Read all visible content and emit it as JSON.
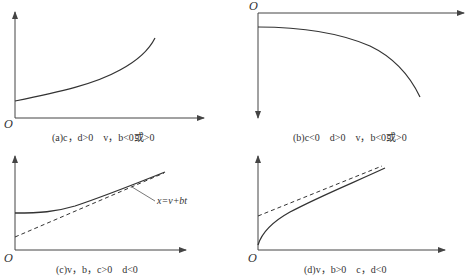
{
  "panels": [
    {
      "id": "a",
      "origin_label": "O",
      "caption": "(a)c，d>0　v，b<0或>0",
      "orientation": "y-up",
      "curves": [
        {
          "style": "solid",
          "shape": "convex increasing"
        }
      ]
    },
    {
      "id": "b",
      "origin_label": "O",
      "caption": "(b)c<0　d>0　v，b<0或>0",
      "orientation": "y-down",
      "curves": [
        {
          "style": "solid",
          "shape": "concave decreasing"
        }
      ]
    },
    {
      "id": "c",
      "origin_label": "O",
      "caption": "(c)v，b，c>0　d<0",
      "orientation": "y-up",
      "annotation": "x=v+bt",
      "curves": [
        {
          "style": "solid",
          "shape": "convex increasing, asymptotic to line"
        },
        {
          "style": "dashed",
          "shape": "asymptote x=v+bt"
        }
      ]
    },
    {
      "id": "d",
      "origin_label": "O",
      "caption": "(d)v，b>0　c，d<0",
      "orientation": "y-up",
      "curves": [
        {
          "style": "solid",
          "shape": "concave increasing, asymptotic to line"
        },
        {
          "style": "dashed",
          "shape": "asymptote"
        }
      ]
    }
  ],
  "colors": {
    "line": "#333333",
    "axis": "#444444",
    "background": "#ffffff"
  }
}
